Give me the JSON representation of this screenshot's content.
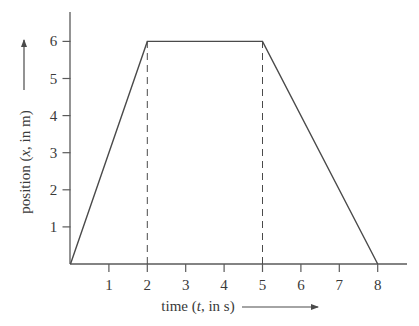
{
  "chart_data": {
    "type": "line",
    "title": "",
    "xlabel": "time (t, in s)",
    "ylabel": "position (x, in m)",
    "xlabel_parts": {
      "pre": "time (",
      "var": "t",
      "post": ", in s)"
    },
    "ylabel_parts": {
      "pre": "position (",
      "var": "x",
      "post": ", in m)"
    },
    "x_ticks": [
      1,
      2,
      3,
      4,
      5,
      6,
      7,
      8
    ],
    "y_ticks": [
      1,
      2,
      3,
      4,
      5,
      6
    ],
    "xlim": [
      0,
      8.8
    ],
    "ylim": [
      0,
      6.5
    ],
    "grid": false,
    "legend": null,
    "series": [
      {
        "name": "position",
        "x": [
          0,
          2,
          5,
          8
        ],
        "y": [
          0,
          6,
          6,
          0
        ]
      }
    ],
    "reference_lines": [
      {
        "orientation": "vertical",
        "x": 2,
        "from_y": 0,
        "to_y": 6,
        "style": "dashed"
      },
      {
        "orientation": "vertical",
        "x": 5,
        "from_y": 0,
        "to_y": 6,
        "style": "dashed"
      }
    ],
    "annotations": [
      {
        "type": "arrow",
        "direction": "up",
        "near": "y-axis label"
      },
      {
        "type": "arrow",
        "direction": "right",
        "near": "x-axis label"
      }
    ]
  },
  "colors": {
    "line": "#4a4a4a",
    "axis": "#5a5a5a",
    "text": "#3a3a3a",
    "background": "#ffffff"
  }
}
